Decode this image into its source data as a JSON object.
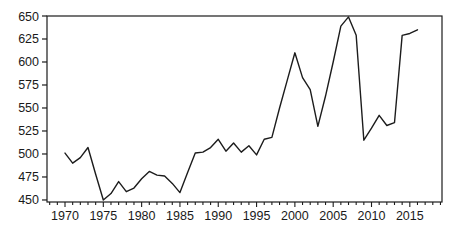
{
  "chart_data": {
    "type": "line",
    "title": "",
    "xlabel": "",
    "ylabel": "",
    "grid": false,
    "legend": null,
    "frame": "box",
    "background": "#ffffff",
    "line_color": "#1c1c1c",
    "axis_color": "#1c1c1c",
    "text_color": "#1a1a1a",
    "xlim": [
      1967.65,
      2019.2
    ],
    "ylim": [
      447.8,
      650
    ],
    "y_ticks": [
      450,
      475,
      500,
      525,
      550,
      575,
      600,
      625,
      650
    ],
    "x_ticks_major": [
      1970,
      1975,
      1980,
      1985,
      1990,
      1995,
      2000,
      2005,
      2010,
      2015
    ],
    "x_minor_tick_start": 1968,
    "x_minor_tick_end": 2019,
    "x": [
      1970,
      1971,
      1972,
      1973,
      1974,
      1975,
      1976,
      1977,
      1978,
      1979,
      1980,
      1981,
      1982,
      1983,
      1984,
      1985,
      1986,
      1987,
      1988,
      1989,
      1990,
      1991,
      1992,
      1993,
      1994,
      1995,
      1996,
      1997,
      1998,
      1999,
      2000,
      2001,
      2002,
      2003,
      2004,
      2005,
      2006,
      2007,
      2008,
      2009,
      2010,
      2011,
      2012,
      2013,
      2014,
      2015,
      2016
    ],
    "series": [
      {
        "name": "series-1",
        "values": [
          501,
          490,
          496,
          507,
          478,
          450,
          457,
          470,
          459,
          463,
          473,
          481,
          477,
          476,
          468,
          458,
          480,
          501,
          502,
          507,
          516,
          503,
          512,
          502,
          509,
          499,
          516,
          518,
          550,
          580,
          610,
          583,
          570,
          530,
          563,
          600,
          639,
          649,
          629,
          515,
          528,
          542,
          531,
          534,
          629,
          631,
          635
        ]
      }
    ]
  }
}
